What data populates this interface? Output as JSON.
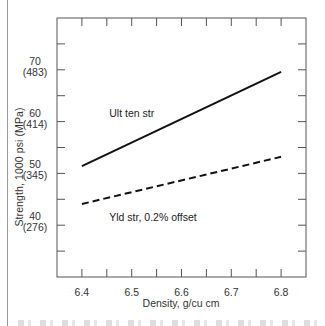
{
  "chart_data": {
    "type": "line",
    "title": "",
    "xlabel": "Density, g/cu cm",
    "ylabel": "Strength, 1000 psi (MPa)",
    "xlim": [
      6.35,
      6.85
    ],
    "ylim": [
      30,
      80
    ],
    "x_ticks": [
      6.35,
      6.4,
      6.45,
      6.5,
      6.55,
      6.6,
      6.65,
      6.7,
      6.75,
      6.8,
      6.85
    ],
    "x_tick_labels": [
      {
        "value": 6.4,
        "label": "6.4"
      },
      {
        "value": 6.5,
        "label": "6.5"
      },
      {
        "value": 6.6,
        "label": "6.6"
      },
      {
        "value": 6.7,
        "label": "6.7"
      },
      {
        "value": 6.8,
        "label": "6.8"
      }
    ],
    "y_ticks": [
      35,
      40,
      45,
      50,
      55,
      60,
      65,
      70,
      75
    ],
    "y_tick_labels": [
      {
        "value": 70,
        "label": "70",
        "sublabel": "(483)"
      },
      {
        "value": 60,
        "label": "60",
        "sublabel": "(414)"
      },
      {
        "value": 50,
        "label": "50",
        "sublabel": "(345)"
      },
      {
        "value": 40,
        "label": "40",
        "sublabel": "(276)"
      }
    ],
    "grid": false,
    "legend": "inline labels",
    "series": [
      {
        "name": "Ult ten str",
        "style": "solid",
        "x": [
          6.4,
          6.8
        ],
        "values": [
          51.4,
          69.6
        ],
        "label_pos": {
          "x": 6.455,
          "y": 61.6
        }
      },
      {
        "name": "Yld str, 0.2% offset",
        "style": "dashed",
        "x": [
          6.4,
          6.8
        ],
        "values": [
          44.1,
          53.2
        ],
        "label_pos": {
          "x": 6.455,
          "y": 41.6
        }
      }
    ]
  },
  "colors": {
    "line": "#111111",
    "axis": "#555555",
    "text": "#333333"
  }
}
